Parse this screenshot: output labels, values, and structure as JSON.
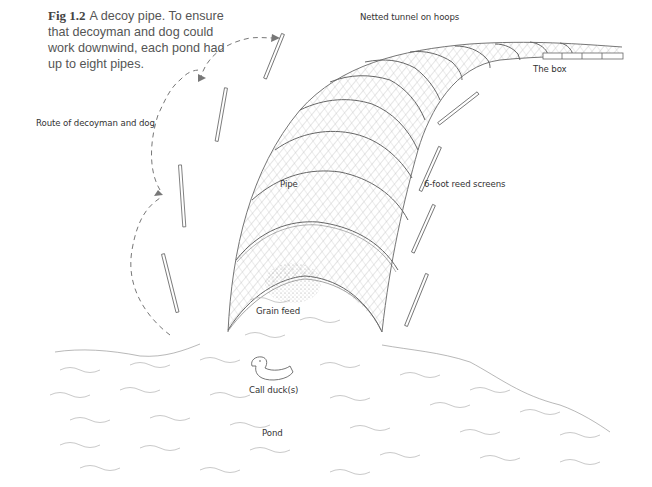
{
  "figure": {
    "number": "Fig 1.2",
    "caption": "A decoy pipe. To ensure that decoyman and dog could work downwind, each pond had up to eight pipes."
  },
  "labels": {
    "tunnel": "Netted tunnel on hoops",
    "box": "The box",
    "route": "Route of decoyman and dog",
    "pipe": "Pipe",
    "reed_screens": "6-foot reed screens",
    "grain_feed": "Grain feed",
    "call_duck": "Call duck(s)",
    "pond": "Pond"
  },
  "colors": {
    "ink": "#555555",
    "hatch": "#9a9a9a",
    "water": "#b5b5b5",
    "background": "#ffffff"
  }
}
